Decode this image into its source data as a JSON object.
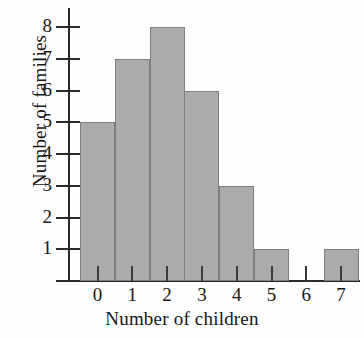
{
  "chart_data": {
    "type": "bar",
    "title": "",
    "subtitle": "",
    "xlabel": "Number of children",
    "ylabel": "Number of families",
    "categories": [
      "0",
      "1",
      "2",
      "3",
      "4",
      "5",
      "6",
      "7"
    ],
    "values": [
      5,
      7,
      8,
      6,
      3,
      1,
      0,
      1
    ],
    "ytick_labels": [
      "1",
      "2",
      "3",
      "4",
      "5",
      "6",
      "7",
      "8"
    ],
    "ytick_values": [
      1,
      2,
      3,
      4,
      5,
      6,
      7,
      8
    ],
    "ylim": [
      0,
      8.6
    ],
    "xlim_categories": [
      "0",
      "7"
    ],
    "grid": false,
    "legend": false,
    "legend_position": "none",
    "annotations": [],
    "bar_fill_color": "#ababab",
    "bar_edge_color": "#7e7e7e",
    "axis_color": "#2a2a2a",
    "text_color": "#161616",
    "background_color": "#ffffff"
  },
  "figure": {
    "ylabel_text": "Number of families",
    "xlabel_text": "Number of children"
  }
}
